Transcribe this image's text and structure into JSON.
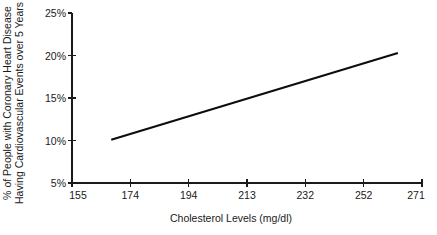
{
  "chart_data": {
    "type": "line",
    "title": "",
    "subtitle": "",
    "xlabel": "Cholesterol Levels (mg/dl)",
    "ylabel": "% of People with Coronary Heart Disease Having Cardiovascular Events over 5 Years",
    "ylabel_line1": "% of People with Coronary Heart Disease",
    "ylabel_line2": "Having Cardiovascular Events over 5 Years",
    "xlim": [
      155,
      271
    ],
    "ylim": [
      5,
      25
    ],
    "xticks": [
      155,
      174,
      194,
      213,
      232,
      252,
      271
    ],
    "xtick_labels": [
      "155",
      "174",
      "194",
      "213",
      "232",
      "252",
      "271"
    ],
    "yticks": [
      5,
      10,
      15,
      20,
      25
    ],
    "ytick_labels": [
      "5%",
      "10%",
      "15%",
      "20%",
      "25%"
    ],
    "grid": false,
    "legend": false,
    "legend_position": "none",
    "line_color": "#0d0d0d",
    "axis_color": "#1a1a1a",
    "background_color": "#ffffff",
    "series": [
      {
        "name": "Risk of cardiovascular events",
        "x": [
          168,
          263
        ],
        "values": [
          10.1,
          20.3
        ]
      }
    ]
  }
}
